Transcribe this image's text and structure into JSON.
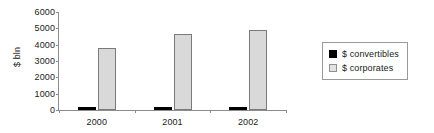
{
  "chart_data": {
    "type": "bar",
    "title": "",
    "xlabel": "",
    "ylabel": "$ bln",
    "categories": [
      "2000",
      "2001",
      "2002"
    ],
    "series": [
      {
        "name": "$ convertibles",
        "values": [
          160,
          210,
          200
        ],
        "color": "#000000"
      },
      {
        "name": "$ corporates",
        "values": [
          3800,
          4650,
          4900
        ],
        "color": "#d9d9d9"
      }
    ],
    "ylim": [
      0,
      6000
    ],
    "ytick_labels": [
      "0",
      "1000",
      "2000",
      "3000",
      "4000",
      "5000",
      "6000"
    ],
    "ytick_values": [
      0,
      1000,
      2000,
      3000,
      4000,
      5000,
      6000
    ],
    "grid": false,
    "legend_position": "right"
  },
  "legend": {
    "entries": [
      {
        "label": "$ convertibles",
        "swatch": "black-square-icon"
      },
      {
        "label": "$ corporates",
        "swatch": "gray-square-icon"
      }
    ]
  }
}
